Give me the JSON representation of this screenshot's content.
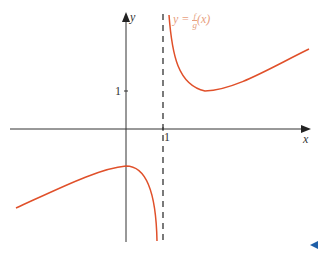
{
  "diagram": {
    "axes": {
      "x_label": "x",
      "y_label": "y"
    },
    "ticks": {
      "x_tick": "1",
      "y_tick": "1"
    },
    "curve_label": {
      "prefix": "y = ",
      "numerator": "f",
      "denominator": "g",
      "suffix": "(x)"
    },
    "asymptote": "x = 1 (dashed vertical)",
    "colors": {
      "curve": "#e0502a",
      "label": "#e8a080",
      "axis": "#333333",
      "nav_arrow": "#1f5fa8"
    }
  },
  "nav": {
    "icon": "previous-arrow"
  }
}
